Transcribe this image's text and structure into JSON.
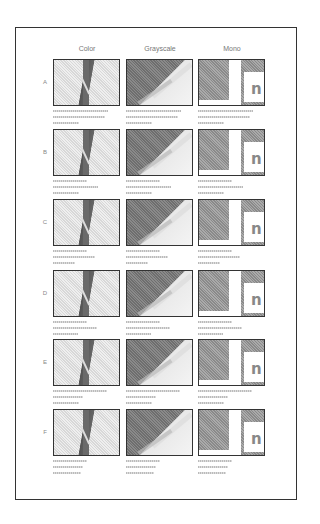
{
  "columns": [
    "Color",
    "Grayscale",
    "Mono"
  ],
  "rows": [
    {
      "label": "A"
    },
    {
      "label": "B"
    },
    {
      "label": "C"
    },
    {
      "label": "D"
    },
    {
      "label": "E"
    },
    {
      "label": "F"
    }
  ],
  "thumbnail_types": [
    "color-leaf-photo",
    "grayscale-leaf-photo",
    "mono-graphic-n"
  ],
  "colors": {
    "border": "#333333",
    "label": "#777777",
    "caption": "#bbbbbb"
  }
}
